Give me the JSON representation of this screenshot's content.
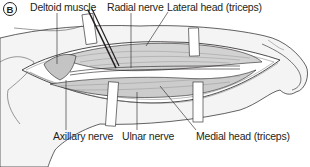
{
  "figure": {
    "panel_label": "B",
    "labels": {
      "deltoid_muscle": "Deltoid muscle",
      "radial_nerve": "Radial nerve",
      "lateral_head": "Lateral head (triceps)",
      "axillary_nerve": "Axillary nerve",
      "ulnar_nerve": "Ulnar nerve",
      "medial_head": "Medial head (triceps)"
    },
    "colors": {
      "line": "#231f20",
      "muscle_fill": "#c9c9c9",
      "skin_fill": "#f4f4f4",
      "background": "#ffffff"
    }
  }
}
